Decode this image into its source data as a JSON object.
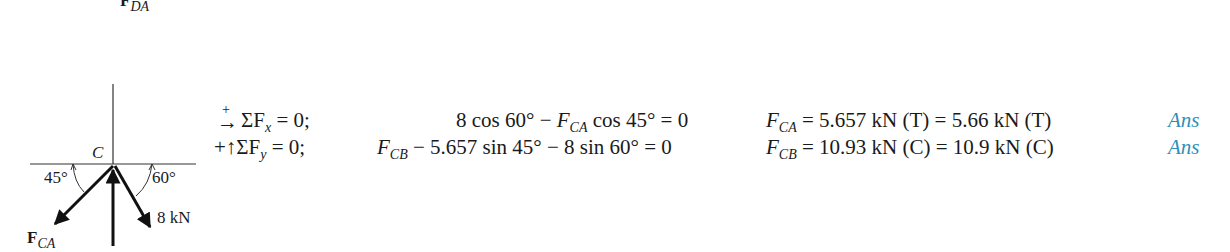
{
  "top_label": {
    "main": "F",
    "sub": "DA"
  },
  "diagram": {
    "node": "C",
    "angle_left": "45°",
    "angle_right": "60°",
    "force_right": "8 kN",
    "force_left": {
      "main": "F",
      "sub": "CA"
    }
  },
  "equations": [
    {
      "direction": "→ (+)",
      "sum": "ΣF",
      "sum_sub": "x",
      "sum_tail": " = 0;",
      "expr_a": "8 cos 60° − ",
      "expr_var": "F",
      "expr_var_sub": "CA",
      "expr_b": " cos 45° = 0",
      "res_var": "F",
      "res_sub": "CA",
      "result": " = 5.657 kN (T) = 5.66 kN (T)",
      "ans": "Ans"
    },
    {
      "direction": "+↑",
      "sum": "ΣF",
      "sum_sub": "y",
      "sum_tail": " = 0;",
      "expr_var": "F",
      "expr_var_sub": "CB",
      "expr_b": " − 5.657 sin 45° − 8 sin 60° = 0",
      "res_var": "F",
      "res_sub": "CB",
      "result": " = 10.93 kN (C) = 10.9 kN (C)",
      "ans": "Ans"
    }
  ]
}
